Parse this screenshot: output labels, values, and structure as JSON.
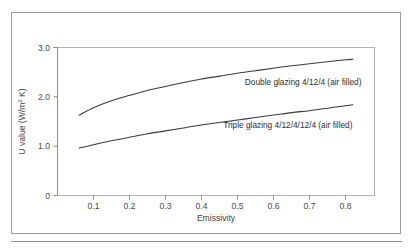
{
  "chart_data": {
    "type": "line",
    "title": "",
    "xlabel": "Emissivity",
    "ylabel": "U value (W/m² K)",
    "ylabel_main": "U value (W/m",
    "ylabel_sup": "2",
    "ylabel_tail": " K)",
    "xlim": [
      0.0,
      0.88
    ],
    "ylim": [
      0,
      3.0
    ],
    "grid": false,
    "legend": "inline-annotations",
    "xticks": [
      0.1,
      0.2,
      0.3,
      0.4,
      0.5,
      0.6,
      0.7,
      0.8
    ],
    "xtick_labels": [
      "0.1",
      "0.2",
      "0.3",
      "0.4",
      "0.5",
      "0.6",
      "0.7",
      "0.8"
    ],
    "yticks": [
      0,
      1.0,
      2.0,
      3.0
    ],
    "ytick_labels": [
      "0",
      "1.0",
      "2.0",
      "3.0"
    ],
    "x": [
      0.06,
      0.1,
      0.15,
      0.2,
      0.25,
      0.3,
      0.35,
      0.4,
      0.45,
      0.5,
      0.55,
      0.6,
      0.65,
      0.7,
      0.75,
      0.8,
      0.82
    ],
    "series": [
      {
        "name": "Double glazing 4/12/4 (air filled)",
        "label": "Double glazing 4/12/4 (air filled)",
        "values": [
          1.63,
          1.78,
          1.92,
          2.03,
          2.13,
          2.21,
          2.29,
          2.36,
          2.42,
          2.48,
          2.53,
          2.58,
          2.63,
          2.67,
          2.71,
          2.75,
          2.76
        ]
      },
      {
        "name": "Triple glazing 4/12/4/12/4 (air filled)",
        "label": "Triple glazing 4/12/4/12/4 (air filled)",
        "values": [
          0.96,
          1.03,
          1.11,
          1.18,
          1.25,
          1.31,
          1.37,
          1.43,
          1.48,
          1.53,
          1.58,
          1.63,
          1.68,
          1.72,
          1.77,
          1.82,
          1.84
        ]
      }
    ],
    "annotations": [
      {
        "text": "Double glazing 4/12/4 (air filled)",
        "x": 0.52,
        "y": 2.3
      },
      {
        "text": "Triple glazing 4/12/4/12/4 (air filled)",
        "x": 0.46,
        "y": 1.42
      }
    ]
  },
  "colors": {
    "curve": "#3a3a3a",
    "axis": "#8c8c8c",
    "frame": "#9a9a9a",
    "text": "#3d3d3d",
    "background": "#ffffff"
  }
}
